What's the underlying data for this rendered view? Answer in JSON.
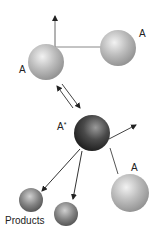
{
  "diagram": {
    "nodes": [
      {
        "id": "a_top_left",
        "label": "A",
        "kind": "molecule",
        "color": "#b8b8b8"
      },
      {
        "id": "a_top_right",
        "label": "A",
        "kind": "molecule",
        "color": "#b8b8b8"
      },
      {
        "id": "a_star",
        "label": "A",
        "superscript": "*",
        "kind": "activated-molecule",
        "color": "#3a3a3a"
      },
      {
        "id": "a_bottom_right",
        "label": "A",
        "kind": "molecule",
        "color": "#b8b8b8"
      },
      {
        "id": "product_1",
        "label": "",
        "kind": "product",
        "color": "#7a7a7a"
      },
      {
        "id": "product_2",
        "label": "",
        "kind": "product",
        "color": "#7a7a7a"
      }
    ],
    "products_label": "Products",
    "edges": [
      {
        "from": "a_top_left",
        "to": "a_star",
        "type": "reversible"
      },
      {
        "from": "a_star",
        "to": "product_1",
        "type": "arrow"
      },
      {
        "from": "a_star",
        "to": "product_2",
        "type": "arrow"
      },
      {
        "from": "a_bottom_right",
        "to": "a_star",
        "type": "collision-path"
      }
    ]
  }
}
